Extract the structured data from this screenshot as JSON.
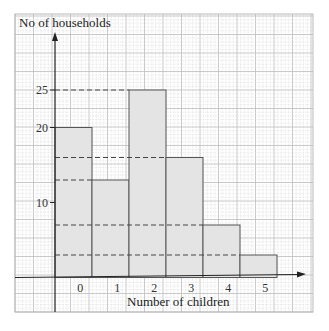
{
  "chart_data": {
    "type": "bar",
    "title": "",
    "ylabel": "No of households",
    "xlabel": "Number of children",
    "categories": [
      "0",
      "1",
      "2",
      "3",
      "4",
      "5"
    ],
    "values": [
      20,
      13,
      25,
      16,
      7,
      3
    ],
    "ylim": [
      0,
      30
    ],
    "yticks": [
      10,
      20,
      25
    ],
    "ytick_labels": [
      "10",
      "20",
      "25"
    ],
    "grid": true,
    "legend": "none",
    "reference_lines": "dashed horizontal lines from y-axis to each bar top",
    "bar_fill": "#e4e4e4",
    "bar_stroke": "#555555",
    "grid_minor_color": "#d8d8d8",
    "grid_major_color": "#bdbdbd"
  }
}
